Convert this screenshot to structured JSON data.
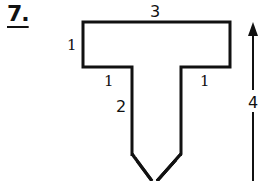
{
  "problem": {
    "number": "7."
  },
  "figure": {
    "shape": "T-shaped outline with pointed bottom",
    "labels": {
      "top_width": "3",
      "arm_height": "1",
      "left_overhang": "1",
      "right_overhang": "1",
      "stem_length": "2",
      "total_height": "4"
    },
    "stroke_color": "#111111",
    "background": "#ffffff"
  }
}
